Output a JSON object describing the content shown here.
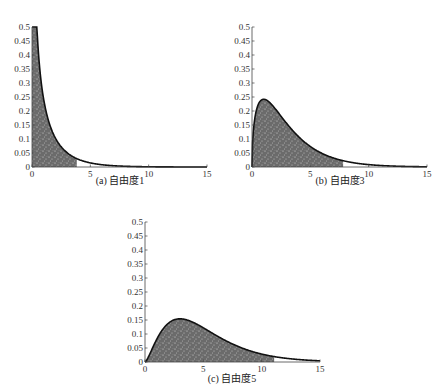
{
  "header_fragment": "",
  "chart_data": [
    {
      "type": "area",
      "id": "a",
      "title": "(a)  自由度1",
      "caption_label": "(a)",
      "caption_text": "自由度1",
      "distribution": "chi-square pdf",
      "degrees_of_freedom": 1,
      "shaded_region": [
        0,
        3.84
      ],
      "xlim": [
        0,
        15
      ],
      "ylim": [
        0,
        0.5
      ],
      "xticks": [
        0,
        5,
        10,
        15
      ],
      "yticks": [
        0,
        0.05,
        0.1,
        0.15,
        0.2,
        0.25,
        0.3,
        0.35,
        0.4,
        0.45,
        0.5
      ],
      "ytick_labels": [
        "0",
        "0.05",
        "0.1",
        "0.15",
        "0.2",
        "0.25",
        "0.3",
        "0.35",
        "0.4",
        "0.45",
        "0.5"
      ],
      "xtick_labels": [
        "0",
        "5",
        "10",
        "15"
      ],
      "x": [
        0.1,
        0.5,
        1,
        2,
        3,
        3.84,
        5,
        7,
        10,
        15
      ],
      "y": [
        1.2,
        0.44,
        0.24,
        0.1,
        0.05,
        0.03,
        0.015,
        0.004,
        0.0009,
        0.0001
      ],
      "grid": false,
      "box": {
        "left": 32,
        "right": 207,
        "top": 27,
        "bottom": 167
      },
      "caption_pos": {
        "x": 120,
        "y": 184
      }
    },
    {
      "type": "area",
      "id": "b",
      "title": "(b)  自由度3",
      "caption_label": "(b)",
      "caption_text": "自由度3",
      "distribution": "chi-square pdf",
      "degrees_of_freedom": 3,
      "shaded_region": [
        0,
        7.81
      ],
      "xlim": [
        0,
        15
      ],
      "ylim": [
        0,
        0.5
      ],
      "xticks": [
        0,
        5,
        10,
        15
      ],
      "yticks": [
        0,
        0.05,
        0.1,
        0.15,
        0.2,
        0.25,
        0.3,
        0.35,
        0.4,
        0.45,
        0.5
      ],
      "ytick_labels": [
        "0",
        "0.05",
        "0.1",
        "0.15",
        "0.2",
        "0.25",
        "0.3",
        "0.35",
        "0.4",
        "0.45",
        "0.5"
      ],
      "xtick_labels": [
        "0",
        "5",
        "10",
        "15"
      ],
      "x": [
        0,
        0.5,
        1,
        2,
        3,
        5,
        7.81,
        10,
        15
      ],
      "y": [
        0,
        0.22,
        0.24,
        0.21,
        0.15,
        0.07,
        0.02,
        0.008,
        0.0007
      ],
      "grid": false,
      "box": {
        "left": 252,
        "right": 427,
        "top": 27,
        "bottom": 167
      },
      "caption_pos": {
        "x": 340,
        "y": 184
      }
    },
    {
      "type": "area",
      "id": "c",
      "title": "(c)  自由度5",
      "caption_label": "(c)",
      "caption_text": "自由度5",
      "distribution": "chi-square pdf",
      "degrees_of_freedom": 5,
      "shaded_region": [
        0,
        11.07
      ],
      "xlim": [
        0,
        15
      ],
      "ylim": [
        0,
        0.5
      ],
      "xticks": [
        0,
        5,
        10,
        15
      ],
      "yticks": [
        0,
        0.05,
        0.1,
        0.15,
        0.2,
        0.25,
        0.3,
        0.35,
        0.4,
        0.45,
        0.5
      ],
      "ytick_labels": [
        "0",
        "0.05",
        "0.1",
        "0.15",
        "0.2",
        "0.25",
        "0.3",
        "0.35",
        "0.4",
        "0.45",
        "0.5"
      ],
      "xtick_labels": [
        "0",
        "5",
        "10",
        "15"
      ],
      "x": [
        0,
        1,
        2,
        3,
        4,
        5,
        7,
        11.07,
        15
      ],
      "y": [
        0,
        0.08,
        0.14,
        0.154,
        0.144,
        0.122,
        0.075,
        0.016,
        0.004
      ],
      "grid": false,
      "box": {
        "left": 145,
        "right": 320,
        "top": 222,
        "bottom": 362
      },
      "caption_pos": {
        "x": 232,
        "y": 382
      }
    }
  ],
  "colors": {
    "shade_fill": "#6b6b6b",
    "shade_speckle": "#d8d8d8",
    "curve": "#111111",
    "axis": "#444444"
  }
}
